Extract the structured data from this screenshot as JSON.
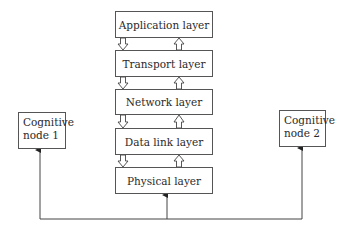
{
  "diagram": {
    "layers": [
      {
        "label": "Application layer"
      },
      {
        "label": "Transport layer"
      },
      {
        "label": "Network layer"
      },
      {
        "label": "Data link layer"
      },
      {
        "label": "Physical layer"
      }
    ],
    "nodes": [
      {
        "line1": "Cognitive",
        "line2": "node 1"
      },
      {
        "line1": "Cognitive",
        "line2": "node 2"
      }
    ],
    "edges": [
      {
        "from": "Application layer",
        "to": "Transport layer",
        "type": "hollow-arrow-down"
      },
      {
        "from": "Transport layer",
        "to": "Application layer",
        "type": "hollow-arrow-up"
      },
      {
        "from": "Transport layer",
        "to": "Network layer",
        "type": "hollow-arrow-down"
      },
      {
        "from": "Network layer",
        "to": "Transport layer",
        "type": "hollow-arrow-up"
      },
      {
        "from": "Network layer",
        "to": "Data link layer",
        "type": "hollow-arrow-down"
      },
      {
        "from": "Data link layer",
        "to": "Network layer",
        "type": "hollow-arrow-up"
      },
      {
        "from": "Data link layer",
        "to": "Physical layer",
        "type": "hollow-arrow-down"
      },
      {
        "from": "Physical layer",
        "to": "Data link layer",
        "type": "hollow-arrow-up"
      },
      {
        "from": "bus",
        "to": "Physical layer",
        "type": "solid-arrow"
      },
      {
        "from": "bus",
        "to": "Cognitive node 1",
        "type": "solid-arrow"
      },
      {
        "from": "bus",
        "to": "Cognitive node 2",
        "type": "solid-arrow"
      }
    ]
  }
}
